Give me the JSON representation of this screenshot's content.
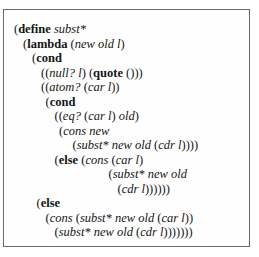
{
  "code": {
    "language": "scheme",
    "lines": [
      {
        "indent": 0,
        "tokens": [
          {
            "t": "p",
            "v": "("
          },
          {
            "t": "kw",
            "v": "define"
          },
          {
            "t": "p",
            "v": " "
          },
          {
            "t": "id",
            "v": "subst*"
          }
        ]
      },
      {
        "indent": 1,
        "tokens": [
          {
            "t": "p",
            "v": "("
          },
          {
            "t": "kw",
            "v": "lambda"
          },
          {
            "t": "p",
            "v": " ("
          },
          {
            "t": "id",
            "v": "new old l"
          },
          {
            "t": "p",
            "v": ")"
          }
        ]
      },
      {
        "indent": 2,
        "tokens": [
          {
            "t": "p",
            "v": "("
          },
          {
            "t": "kw",
            "v": "cond"
          }
        ]
      },
      {
        "indent": 3,
        "tokens": [
          {
            "t": "p",
            "v": "(("
          },
          {
            "t": "id",
            "v": "null? l"
          },
          {
            "t": "p",
            "v": ") ("
          },
          {
            "t": "kw",
            "v": "quote"
          },
          {
            "t": "p",
            "v": " ()))"
          }
        ]
      },
      {
        "indent": 3,
        "tokens": [
          {
            "t": "p",
            "v": "(("
          },
          {
            "t": "id",
            "v": "atom?"
          },
          {
            "t": "p",
            "v": " ("
          },
          {
            "t": "id",
            "v": "car l"
          },
          {
            "t": "p",
            "v": "))"
          }
        ]
      },
      {
        "indent": 3.5,
        "tokens": [
          {
            "t": "p",
            "v": "("
          },
          {
            "t": "kw",
            "v": "cond"
          }
        ]
      },
      {
        "indent": 4.5,
        "tokens": [
          {
            "t": "p",
            "v": "(("
          },
          {
            "t": "id",
            "v": "eq?"
          },
          {
            "t": "p",
            "v": " ("
          },
          {
            "t": "id",
            "v": "car l"
          },
          {
            "t": "p",
            "v": ") "
          },
          {
            "t": "id",
            "v": "old"
          },
          {
            "t": "p",
            "v": ")"
          }
        ]
      },
      {
        "indent": 5,
        "tokens": [
          {
            "t": "p",
            "v": "("
          },
          {
            "t": "id",
            "v": "cons new"
          }
        ]
      },
      {
        "indent": 6.5,
        "tokens": [
          {
            "t": "p",
            "v": "("
          },
          {
            "t": "id",
            "v": "subst* new old"
          },
          {
            "t": "p",
            "v": " ("
          },
          {
            "t": "id",
            "v": "cdr l"
          },
          {
            "t": "p",
            "v": "))))"
          }
        ]
      },
      {
        "indent": 4.5,
        "tokens": [
          {
            "t": "p",
            "v": "("
          },
          {
            "t": "kw",
            "v": "else"
          },
          {
            "t": "p",
            "v": " ("
          },
          {
            "t": "id",
            "v": "cons"
          },
          {
            "t": "p",
            "v": " ("
          },
          {
            "t": "id",
            "v": "car l"
          },
          {
            "t": "p",
            "v": ")"
          }
        ]
      },
      {
        "indent": 10.5,
        "tokens": [
          {
            "t": "p",
            "v": "("
          },
          {
            "t": "id",
            "v": "subst* new old"
          }
        ]
      },
      {
        "indent": 11.5,
        "tokens": [
          {
            "t": "p",
            "v": "("
          },
          {
            "t": "id",
            "v": "cdr l"
          },
          {
            "t": "p",
            "v": "))))))"
          }
        ]
      },
      {
        "indent": 2.5,
        "tokens": [
          {
            "t": "p",
            "v": "("
          },
          {
            "t": "kw",
            "v": "else"
          }
        ]
      },
      {
        "indent": 3.5,
        "tokens": [
          {
            "t": "p",
            "v": "("
          },
          {
            "t": "id",
            "v": "cons"
          },
          {
            "t": "p",
            "v": " ("
          },
          {
            "t": "id",
            "v": "subst* new old"
          },
          {
            "t": "p",
            "v": " ("
          },
          {
            "t": "id",
            "v": "car l"
          },
          {
            "t": "p",
            "v": "))"
          }
        ]
      },
      {
        "indent": 4.5,
        "tokens": [
          {
            "t": "p",
            "v": "("
          },
          {
            "t": "id",
            "v": "subst* new old"
          },
          {
            "t": "p",
            "v": " ("
          },
          {
            "t": "id",
            "v": "cdr l"
          },
          {
            "t": "p",
            "v": ")))))))"
          }
        ]
      }
    ]
  }
}
